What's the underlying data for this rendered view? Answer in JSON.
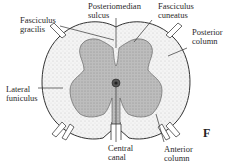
{
  "figure": {
    "letter": "F",
    "labels": {
      "fasciculus_gracilis": "Fasciculus\ngracilis",
      "posteriomedian_sulcus": "Posteriomedian\nsulcus",
      "fasciculus_cuneatus": "Fasciculus\ncuneatus",
      "posterior_column": "Posterior\ncolumn",
      "lateral_funiculus": "Lateral\nfuniculus",
      "central_canal": "Central\ncanal",
      "anterior_column": "Anterior\ncolumn"
    },
    "colors": {
      "gray_matter": "#b9b9b9",
      "white_matter": "#f1f1f1",
      "outline": "#333333"
    }
  }
}
